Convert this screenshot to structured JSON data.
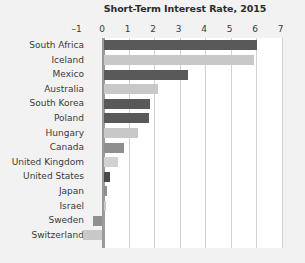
{
  "chart_data": {
    "type": "bar",
    "orientation": "horizontal",
    "title": "Short-Term Interest Rate, 2015",
    "xlabel": "",
    "ylabel": "",
    "xlim": [
      -1,
      7
    ],
    "xticks": [
      -1,
      0,
      1,
      2,
      3,
      4,
      5,
      6,
      7
    ],
    "xtick_labels": [
      "–1",
      "0",
      "1",
      "2",
      "3",
      "4",
      "5",
      "6",
      "7"
    ],
    "grid": true,
    "gridlines": "vertical",
    "legend": "none",
    "categories": [
      "South Africa",
      "Iceland",
      "Mexico",
      "Australia",
      "South Korea",
      "Poland",
      "Hungary",
      "Canada",
      "United Kingdom",
      "United States",
      "Japan",
      "Israel",
      "Sweden",
      "Switzerland"
    ],
    "values": [
      6.0,
      5.9,
      3.3,
      2.1,
      1.8,
      1.75,
      1.35,
      0.8,
      0.55,
      0.25,
      0.1,
      0.08,
      -0.35,
      -0.75
    ],
    "bar_colors": [
      "#595959",
      "#c8c8c8",
      "#595959",
      "#c8c8c8",
      "#595959",
      "#595959",
      "#c8c8c8",
      "#8f8f8f",
      "#d2d2d2",
      "#4a4a4a",
      "#8f8f8f",
      "#c8c8c8",
      "#8f8f8f",
      "#c8c8c8"
    ]
  },
  "colors": {
    "background": "#f2f2f2",
    "plot_background": "#ffffff",
    "gridline": "#d2d2d2",
    "axis": "#9a9a9a",
    "title_text": "#2b2b2b",
    "label_text": "#3a3a3a",
    "bar_dark": "#595959",
    "bar_light": "#c8c8c8"
  }
}
